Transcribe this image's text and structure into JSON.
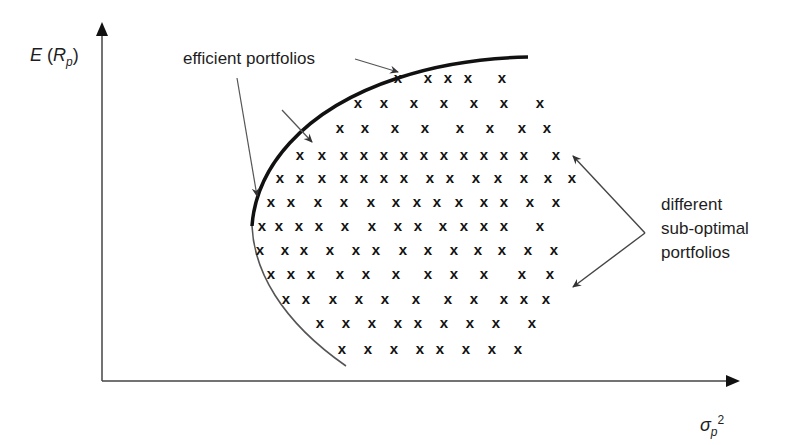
{
  "chart_data": {
    "type": "scatter",
    "title": "",
    "xlabel": "σp²",
    "ylabel": "E(Rp)",
    "grid": false,
    "legend": null,
    "annotations": [
      {
        "text": "efficient portfolios",
        "points_to": "upper branch of the frontier curve (thick line)"
      },
      {
        "text": "different sub-optimal portfolios",
        "points_to": "x marks inside the frontier"
      }
    ],
    "frontier": {
      "efficient_segment": "thick upper branch from the minimum-variance point rising and flattening to the right",
      "inefficient_segment": "thin lower branch descending from the minimum-variance point"
    },
    "markers": "x",
    "rows": [
      {
        "y": 78,
        "x": [
          398,
          428,
          448,
          468,
          502
        ]
      },
      {
        "y": 103,
        "x": [
          358,
          384,
          414,
          444,
          474,
          504,
          540
        ]
      },
      {
        "y": 128,
        "x": [
          340,
          365,
          395,
          425,
          460,
          490,
          522,
          547
        ]
      },
      {
        "y": 155,
        "x": [
          300,
          322,
          344,
          364,
          384,
          404,
          424,
          444,
          464,
          484,
          504,
          524,
          556
        ]
      },
      {
        "y": 178,
        "x": [
          280,
          300,
          322,
          344,
          364,
          384,
          404,
          430,
          450,
          476,
          498,
          524,
          548,
          572
        ]
      },
      {
        "y": 202,
        "x": [
          271,
          291,
          318,
          344,
          371,
          396,
          417,
          437,
          459,
          484,
          504,
          530,
          556
        ]
      },
      {
        "y": 226,
        "x": [
          262,
          279,
          299,
          319,
          345,
          372,
          398,
          418,
          443,
          464,
          484,
          504,
          540
        ]
      },
      {
        "y": 250,
        "x": [
          260,
          285,
          304,
          330,
          356,
          376,
          403,
          428,
          454,
          478,
          502,
          528,
          554
        ]
      },
      {
        "y": 274,
        "x": [
          271,
          291,
          311,
          340,
          366,
          396,
          428,
          454,
          484,
          522,
          550
        ]
      },
      {
        "y": 299,
        "x": [
          286,
          306,
          333,
          359,
          385,
          416,
          448,
          474,
          504,
          524,
          546
        ]
      },
      {
        "y": 323,
        "x": [
          320,
          346,
          372,
          398,
          418,
          444,
          470,
          496,
          532
        ]
      },
      {
        "y": 349,
        "x": [
          342,
          368,
          394,
          420,
          440,
          466,
          492,
          518
        ]
      }
    ]
  },
  "labels": {
    "y_axis_E": "E",
    "y_axis_R": "R",
    "y_axis_sub": "p",
    "x_axis_sigma": "σ",
    "x_axis_sub": "p",
    "x_axis_sup": "2",
    "efficient": "efficient portfolios",
    "suboptimal_line1": "different",
    "suboptimal_line2": "sub-optimal",
    "suboptimal_line3": "portfolios"
  },
  "colors": {
    "ink": "#1e1e1e",
    "background": "#ffffff"
  }
}
